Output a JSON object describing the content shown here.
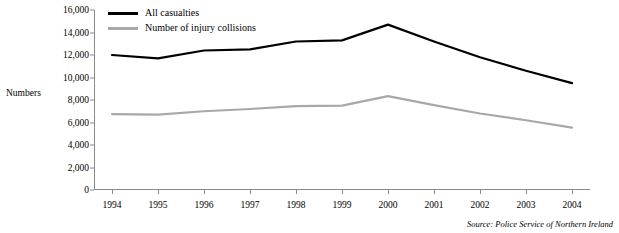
{
  "chart_data": {
    "type": "line",
    "title": "",
    "xlabel": "",
    "ylabel": "Numbers",
    "categories": [
      "1994",
      "1995",
      "1996",
      "1997",
      "1998",
      "1999",
      "2000",
      "2001",
      "2002",
      "2003",
      "2004"
    ],
    "ylim": [
      0,
      16000
    ],
    "yticks": [
      0,
      2000,
      4000,
      6000,
      8000,
      10000,
      12000,
      14000,
      16000
    ],
    "ytick_labels": [
      "0",
      "2,000",
      "4,000",
      "6,000",
      "8,000",
      "10,000",
      "12,000",
      "14,000",
      "16,000"
    ],
    "grid": false,
    "legend_position": "top-left",
    "series": [
      {
        "name": "All casualties",
        "color": "#000000",
        "values": [
          12000,
          11700,
          12400,
          12500,
          13200,
          13300,
          14700,
          13200,
          11800,
          10600,
          9500
        ]
      },
      {
        "name": "Number of injury collisions",
        "color": "#a8a8a8",
        "values": [
          6750,
          6700,
          7000,
          7200,
          7450,
          7500,
          8350,
          7550,
          6800,
          6200,
          5550
        ]
      }
    ],
    "source_note": "Source: Police Service of Northern Ireland"
  }
}
